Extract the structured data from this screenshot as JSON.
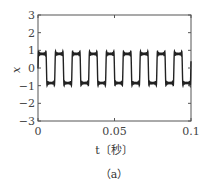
{
  "chart_data": {
    "type": "line",
    "title": "",
    "caption": "（a）",
    "xlabel": "t〔秒〕",
    "ylabel": "x",
    "xlim": [
      0,
      0.1
    ],
    "ylim": [
      -3,
      3
    ],
    "xticks": [
      0,
      0.05,
      0.1
    ],
    "xtick_labels": [
      "0",
      "0.05",
      "0.1"
    ],
    "yticks": [
      3,
      2,
      1,
      0,
      -1,
      -2,
      -3
    ],
    "ytick_labels": [
      "3",
      "2",
      "1",
      "0",
      "−1",
      "−2",
      "−3"
    ],
    "grid": false,
    "legend": null,
    "series": [
      {
        "name": "x(t)",
        "description": "square-like wave with ripple, ~9 periods over 0.1 s",
        "high": 0.8,
        "low": -0.85,
        "period": 0.0111,
        "phase_start": "high",
        "color": "#222222"
      }
    ]
  }
}
